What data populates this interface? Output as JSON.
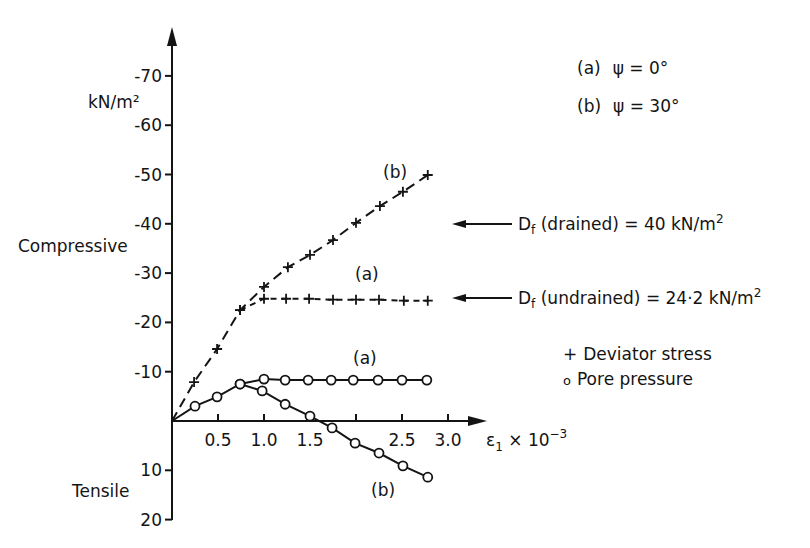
{
  "chart_data": {
    "type": "line",
    "title": "",
    "xlabel": "ε1 × 10^-3",
    "ylabel": "kN/m²",
    "xlim": [
      0,
      3.0
    ],
    "ylim": [
      -70,
      20
    ],
    "y_axis_inverted": true,
    "x_ticks": [
      "0.5",
      "1.0",
      "1.5",
      "2.0",
      "2.5",
      "3.0"
    ],
    "x_tick_values": [
      0.5,
      1.0,
      1.5,
      2.0,
      2.5,
      3.0
    ],
    "x_tick_labels_shown": [
      "0.5",
      "1.0",
      "1.5",
      "2.5",
      "3.0"
    ],
    "y_ticks": [
      "-70",
      "-60",
      "-50",
      "-40",
      "-30",
      "-20",
      "-10",
      "10",
      "20"
    ],
    "y_tick_values": [
      -70,
      -60,
      -50,
      -40,
      -30,
      -20,
      -10,
      10,
      20
    ],
    "region_labels": {
      "compressive": "Compressive",
      "tensile": "Tensile"
    },
    "legend": {
      "cases": [
        {
          "key": "(a)",
          "text": "ψ = 0°"
        },
        {
          "key": "(b)",
          "text": "ψ = 30°"
        }
      ],
      "markers": [
        {
          "symbol": "+",
          "text": "Deviator stress"
        },
        {
          "symbol": "o",
          "text": "Pore pressure"
        }
      ]
    },
    "annotations": [
      {
        "text_main": "D",
        "text_sub": "f",
        "text_rest": " (drained) = 40 kN/m",
        "sup": "2",
        "value": -40
      },
      {
        "text_main": "D",
        "text_sub": "f",
        "text_rest": " (undrained) = 24·2 kN/m",
        "sup": "2",
        "value": -24.2
      }
    ],
    "series": [
      {
        "name": "Deviator stress (b) ψ = 30°",
        "label": "(b)",
        "marker": "plus",
        "line": "dash",
        "x": [
          0,
          0.24,
          0.49,
          0.74,
          1.0,
          1.26,
          1.5,
          1.75,
          2.0,
          2.26,
          2.51,
          2.78
        ],
        "y": [
          0,
          -7.9,
          -14.6,
          -22.5,
          -27.2,
          -31.2,
          -33.7,
          -36.7,
          -40.2,
          -43.6,
          -46.5,
          -49.9
        ]
      },
      {
        "name": "Deviator stress (a) ψ = 0°",
        "label": "(a)",
        "marker": "plus",
        "line": "dash-fine",
        "x": [
          0.74,
          1.0,
          1.24,
          1.49,
          1.75,
          2.0,
          2.25,
          2.52,
          2.78
        ],
        "y": [
          -22.5,
          -24.8,
          -24.8,
          -24.8,
          -24.6,
          -24.6,
          -24.6,
          -24.4,
          -24.4
        ]
      },
      {
        "name": "Pore pressure (a) ψ = 0°",
        "label": "(a)",
        "marker": "circle",
        "line": "solid",
        "x": [
          0,
          0.25,
          0.49,
          0.74,
          1.0,
          1.23,
          1.48,
          1.73,
          1.97,
          2.24,
          2.5,
          2.77
        ],
        "y": [
          0,
          -3.0,
          -4.9,
          -7.5,
          -8.5,
          -8.3,
          -8.3,
          -8.3,
          -8.3,
          -8.3,
          -8.3,
          -8.3
        ]
      },
      {
        "name": "Pore pressure (b) ψ = 30°",
        "label": "(b)",
        "marker": "circle",
        "line": "solid",
        "x": [
          0.74,
          0.98,
          1.23,
          1.5,
          1.74,
          1.99,
          2.25,
          2.51,
          2.78
        ],
        "y": [
          -7.5,
          -6.1,
          -3.4,
          -1.0,
          1.4,
          4.5,
          6.5,
          9.1,
          11.4
        ]
      }
    ],
    "series_label_positions": [
      {
        "text": "(b)",
        "x": 383,
        "y": 178
      },
      {
        "text": "(a)",
        "x": 355,
        "y": 280
      },
      {
        "text": "(a)",
        "x": 353,
        "y": 364
      },
      {
        "text": "(b)",
        "x": 371,
        "y": 496
      }
    ],
    "grid": false
  }
}
